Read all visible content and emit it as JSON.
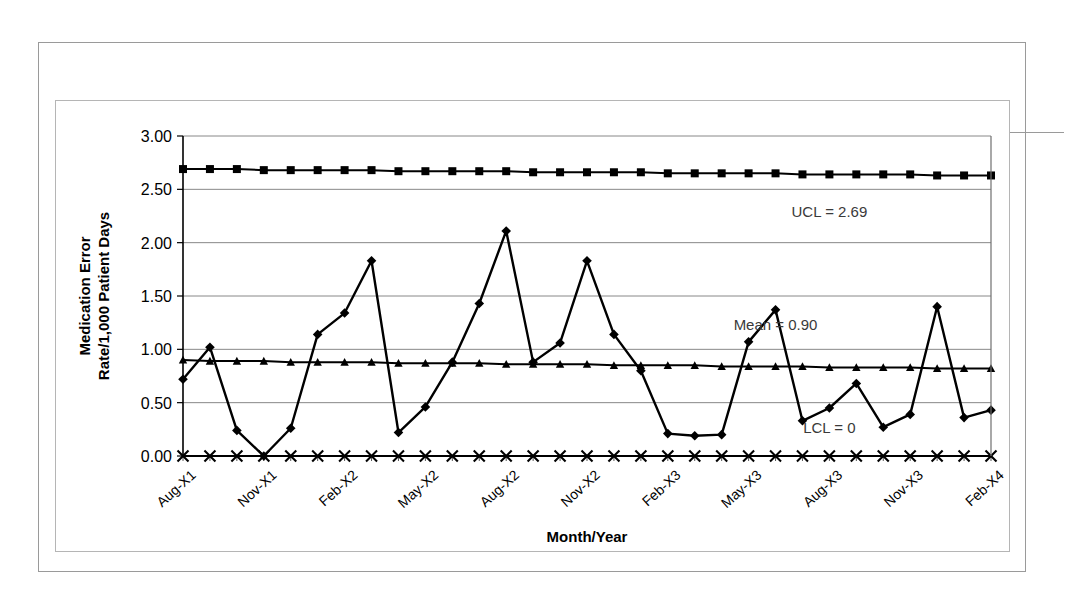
{
  "exhibit": {
    "number": "Exhibit 16–10",
    "caption": "Control Chart"
  },
  "chart_data": {
    "type": "line",
    "title": "",
    "xlabel": "Month/Year",
    "ylabel": "Medication Error Rate/1,000 Patient Days",
    "ylim": [
      0.0,
      3.0
    ],
    "ytick_labels": [
      "0.00",
      "0.50",
      "1.00",
      "1.50",
      "2.00",
      "2.50",
      "3.00"
    ],
    "ytick_values": [
      0.0,
      0.5,
      1.0,
      1.5,
      2.0,
      2.5,
      3.0
    ],
    "grid": true,
    "legend": "none",
    "x_tick_labels": [
      "Aug-X1",
      "Nov-X1",
      "Feb-X2",
      "May-X2",
      "Aug-X2",
      "Nov-X2",
      "Feb-X3",
      "May-X3",
      "Aug-X3",
      "Nov-X3",
      "Feb-X4"
    ],
    "x_tick_indices": [
      0,
      3,
      6,
      9,
      12,
      15,
      18,
      21,
      24,
      27,
      30
    ],
    "categories": [
      "Aug-X1",
      "Sep-X1",
      "Oct-X1",
      "Nov-X1",
      "Dec-X1",
      "Jan-X2",
      "Feb-X2",
      "Mar-X2",
      "Apr-X2",
      "May-X2",
      "Jun-X2",
      "Jul-X2",
      "Aug-X2",
      "Sep-X2",
      "Oct-X2",
      "Nov-X2",
      "Dec-X2",
      "Jan-X3",
      "Feb-X3",
      "Mar-X3",
      "Apr-X3",
      "May-X3",
      "Jun-X3",
      "Jul-X3",
      "Aug-X3",
      "Sep-X3",
      "Oct-X3",
      "Nov-X3",
      "Dec-X3",
      "Jan-X4",
      "Feb-X4"
    ],
    "series": [
      {
        "name": "UCL",
        "marker": "square",
        "values": [
          2.69,
          2.69,
          2.69,
          2.68,
          2.68,
          2.68,
          2.68,
          2.68,
          2.67,
          2.67,
          2.67,
          2.67,
          2.67,
          2.66,
          2.66,
          2.66,
          2.66,
          2.66,
          2.65,
          2.65,
          2.65,
          2.65,
          2.65,
          2.64,
          2.64,
          2.64,
          2.64,
          2.64,
          2.63,
          2.63,
          2.63
        ]
      },
      {
        "name": "Medication Error Rate",
        "marker": "diamond",
        "values": [
          0.72,
          1.02,
          0.24,
          0.0,
          0.26,
          1.14,
          1.34,
          1.83,
          0.22,
          0.46,
          0.88,
          1.43,
          2.11,
          0.88,
          1.06,
          1.83,
          1.14,
          0.8,
          0.21,
          0.19,
          0.2,
          1.07,
          1.37,
          0.33,
          0.45,
          0.68,
          0.27,
          0.39,
          1.4,
          0.36,
          0.43
        ]
      },
      {
        "name": "Mean",
        "marker": "triangle",
        "values": [
          0.9,
          0.89,
          0.89,
          0.89,
          0.88,
          0.88,
          0.88,
          0.88,
          0.87,
          0.87,
          0.87,
          0.87,
          0.86,
          0.86,
          0.86,
          0.86,
          0.85,
          0.85,
          0.85,
          0.85,
          0.84,
          0.84,
          0.84,
          0.84,
          0.83,
          0.83,
          0.83,
          0.83,
          0.82,
          0.82,
          0.82
        ]
      },
      {
        "name": "LCL",
        "marker": "x",
        "values": [
          0,
          0,
          0,
          0,
          0,
          0,
          0,
          0,
          0,
          0,
          0,
          0,
          0,
          0,
          0,
          0,
          0,
          0,
          0,
          0,
          0,
          0,
          0,
          0,
          0,
          0,
          0,
          0,
          0,
          0,
          0
        ]
      }
    ],
    "annotations": [
      {
        "text": "UCL = 2.69",
        "x_index": 24,
        "y": 2.24
      },
      {
        "text": "Mean = 0.90",
        "x_index": 22,
        "y": 1.18
      },
      {
        "text": "LCL = 0",
        "x_index": 24,
        "y": 0.22
      }
    ],
    "final_point_value": 0.0,
    "colors": {
      "line": "#000000",
      "grid": "#888888",
      "axis": "#000000",
      "background": "#ffffff",
      "annotation_text": "#3a3a3a"
    }
  }
}
